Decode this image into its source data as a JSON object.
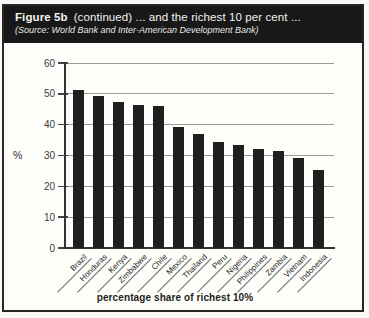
{
  "header": {
    "figure_label": "Figure 5b",
    "title_rest": "(continued) ... and the richest 10 per cent ...",
    "source": "(Source: World Bank and Inter-American Development Bank)"
  },
  "chart_data": {
    "type": "bar",
    "categories": [
      "Brazil",
      "Honduras",
      "Kenya",
      "Zimbabwe",
      "Chile",
      "Mexico",
      "Thailand",
      "Peru",
      "Nigeria",
      "Philippines",
      "Zambia",
      "Vietnam",
      "Indonesia"
    ],
    "values": [
      51.3,
      49.4,
      47.5,
      46.4,
      46.2,
      39.4,
      37.1,
      34.4,
      33.4,
      32.2,
      31.3,
      29.1,
      25.3
    ],
    "title": "",
    "xlabel": "percentage share of richest 10%",
    "ylabel": "%",
    "ylim": [
      0,
      60
    ],
    "yticks": [
      0,
      10,
      20,
      30,
      40,
      50,
      60
    ],
    "grid": true,
    "legend_position": "none",
    "bar_color": "#1f1f1f",
    "grid_color": "#9b9b9b",
    "axis_color": "#333333",
    "band_color": "#181818"
  }
}
